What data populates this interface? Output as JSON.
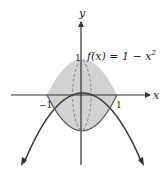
{
  "figure": {
    "function_label": "f(x) = 1 − x",
    "function_exponent": "2",
    "axis_x_label": "x",
    "axis_y_label": "y",
    "tick_left": "−1",
    "tick_right": "1",
    "tick_top": "1",
    "colors": {
      "shade": "#cfcfcf",
      "curve": "#3a3a3a",
      "axis": "#333333",
      "dashed": "#8a8a8a"
    }
  }
}
